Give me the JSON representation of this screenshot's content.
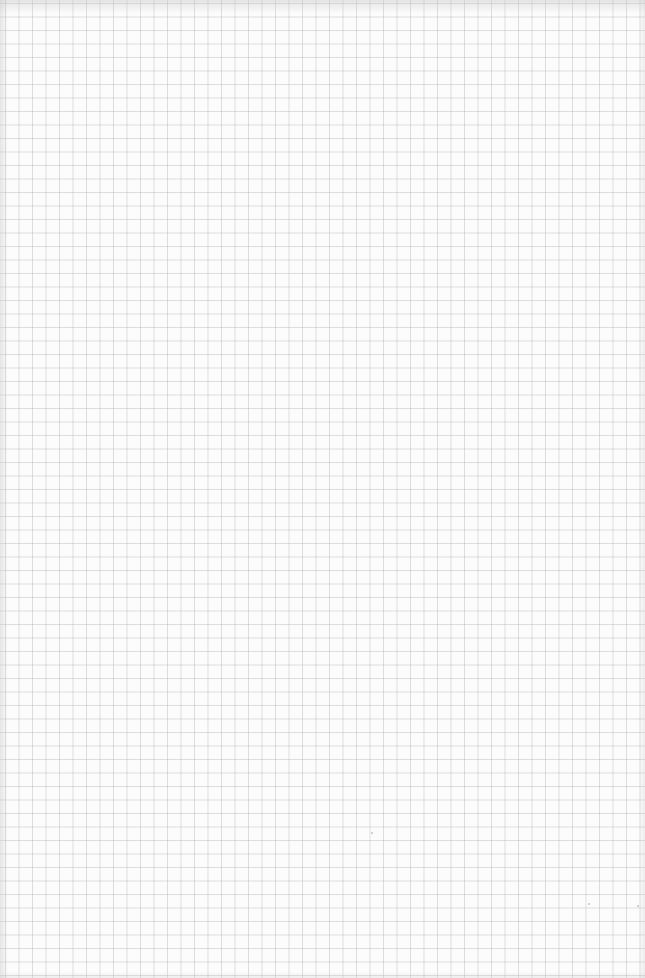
{
  "page": {
    "type": "graph-paper",
    "grid_pitch_px": 13.5,
    "colors": {
      "paper": "#fcfcfc",
      "grid_line": "#d4d4d4",
      "edge_shadow": "#c8c8c8"
    },
    "content": []
  }
}
